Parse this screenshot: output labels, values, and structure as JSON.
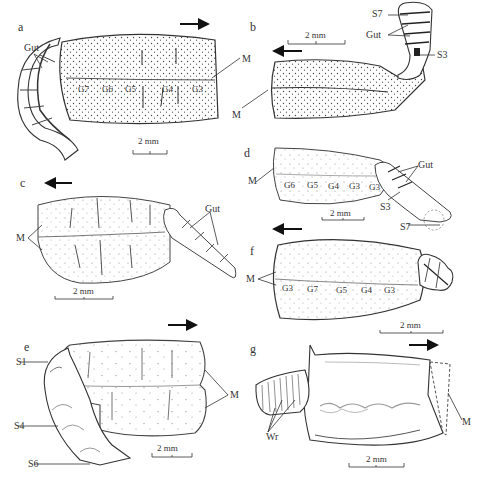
{
  "figure": {
    "panels": [
      {
        "id": "a",
        "letter": "a",
        "direction": "right",
        "scale": "2 mm",
        "labels": {
          "gut": "Gut",
          "m": "M"
        },
        "g_labels": [
          "G7",
          "G6",
          "G5",
          "G4",
          "G3"
        ]
      },
      {
        "id": "b",
        "letter": "b",
        "direction": "left",
        "scale": "2 mm",
        "labels": {
          "s_top": "S7",
          "gut": "Gut",
          "s_bottom": "S3",
          "m": "M"
        }
      },
      {
        "id": "c",
        "letter": "c",
        "direction": "left",
        "scale": "2 mm",
        "labels": {
          "m": "M",
          "gut": "Gut"
        }
      },
      {
        "id": "d",
        "letter": "d",
        "direction": "left",
        "scale": "2 mm",
        "labels": {
          "m": "M",
          "gut": "Gut",
          "s_mid": "S3",
          "s_bottom": "S7"
        },
        "g_labels": [
          "G6",
          "G5",
          "G4",
          "G3",
          "G3"
        ]
      },
      {
        "id": "e",
        "letter": "e",
        "direction": "right",
        "scale": "2 mm",
        "labels": {
          "s1": "S1",
          "s4": "S4",
          "s6": "S6",
          "m": "M"
        }
      },
      {
        "id": "f",
        "letter": "f",
        "direction": "left",
        "scale": "2 mm",
        "labels": {
          "m": "M"
        },
        "g_labels": [
          "G3",
          "G7",
          "G5",
          "G4",
          "G3"
        ]
      },
      {
        "id": "g",
        "letter": "g",
        "direction": "right",
        "scale": "2 mm",
        "labels": {
          "wr": "Wr",
          "m": "M"
        }
      }
    ]
  }
}
